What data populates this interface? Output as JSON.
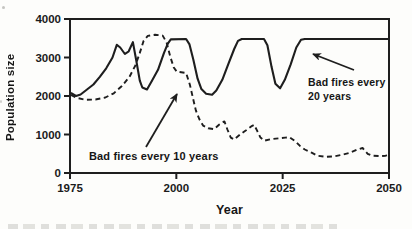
{
  "figure": {
    "background": "#fdfdfb",
    "ink_color": "#1e1e1e"
  },
  "chart_data": {
    "type": "line",
    "title": "",
    "xlabel": "Year",
    "ylabel": "Population size",
    "xlim": [
      1975,
      2050
    ],
    "ylim": [
      0,
      4000
    ],
    "x_ticks": [
      1975,
      2000,
      2025,
      2050
    ],
    "y_ticks": [
      0,
      1000,
      2000,
      3000,
      4000
    ],
    "grid": false,
    "frame": "full-box",
    "legend_position": "in-plot annotations with arrows",
    "series": [
      {
        "name": "Bad fires every 20 years",
        "style": "solid",
        "points": [
          [
            1975.2,
            2080
          ],
          [
            1976.4,
            2000
          ],
          [
            1977.5,
            2040
          ],
          [
            1979,
            2170
          ],
          [
            1980.5,
            2300
          ],
          [
            1982,
            2500
          ],
          [
            1983.5,
            2720
          ],
          [
            1985,
            3000
          ],
          [
            1986,
            3330
          ],
          [
            1986.8,
            3260
          ],
          [
            1987.9,
            3090
          ],
          [
            1988.8,
            3160
          ],
          [
            1989.8,
            3400
          ],
          [
            1990.6,
            2900
          ],
          [
            1991.4,
            2400
          ],
          [
            1992,
            2220
          ],
          [
            1993.1,
            2170
          ],
          [
            1994.3,
            2400
          ],
          [
            1995.7,
            2680
          ],
          [
            1997.1,
            3120
          ],
          [
            1998,
            3360
          ],
          [
            1998.7,
            3470
          ],
          [
            2002.3,
            3480
          ],
          [
            2003.1,
            3340
          ],
          [
            2004,
            2950
          ],
          [
            2005,
            2450
          ],
          [
            2005.9,
            2180
          ],
          [
            2007,
            2060
          ],
          [
            2008.4,
            2030
          ],
          [
            2009.4,
            2140
          ],
          [
            2010.8,
            2420
          ],
          [
            2012.2,
            2820
          ],
          [
            2013.6,
            3220
          ],
          [
            2014.5,
            3430
          ],
          [
            2015.4,
            3480
          ],
          [
            2020.6,
            3480
          ],
          [
            2021.4,
            3320
          ],
          [
            2022.4,
            2750
          ],
          [
            2023.3,
            2320
          ],
          [
            2024.4,
            2200
          ],
          [
            2025.5,
            2420
          ],
          [
            2026.9,
            2820
          ],
          [
            2028.2,
            3260
          ],
          [
            2029.3,
            3460
          ],
          [
            2030.2,
            3480
          ],
          [
            2050,
            3480
          ]
        ]
      },
      {
        "name": "Bad fires every 10 years",
        "style": "dashed",
        "points": [
          [
            1975.2,
            2030
          ],
          [
            1976.6,
            1950
          ],
          [
            1978.6,
            1900
          ],
          [
            1981,
            1910
          ],
          [
            1983.3,
            1960
          ],
          [
            1985.3,
            2070
          ],
          [
            1987.2,
            2260
          ],
          [
            1989,
            2500
          ],
          [
            1990.4,
            2800
          ],
          [
            1991.4,
            3120
          ],
          [
            1992.3,
            3430
          ],
          [
            1993.3,
            3560
          ],
          [
            1995,
            3590
          ],
          [
            1996.8,
            3570
          ],
          [
            1997.7,
            3390
          ],
          [
            1998.6,
            3010
          ],
          [
            1999.4,
            2740
          ],
          [
            2000.1,
            2630
          ],
          [
            2002.3,
            2600
          ],
          [
            2003.2,
            2290
          ],
          [
            2003.9,
            1950
          ],
          [
            2004.6,
            1620
          ],
          [
            2005.4,
            1400
          ],
          [
            2006.3,
            1230
          ],
          [
            2007.5,
            1160
          ],
          [
            2008.9,
            1140
          ],
          [
            2010.1,
            1260
          ],
          [
            2011.3,
            1340
          ],
          [
            2012,
            1130
          ],
          [
            2012.8,
            920
          ],
          [
            2013.6,
            870
          ],
          [
            2015,
            1000
          ],
          [
            2016.4,
            1110
          ],
          [
            2017.6,
            1210
          ],
          [
            2018.3,
            1250
          ],
          [
            2019,
            1100
          ],
          [
            2019.8,
            920
          ],
          [
            2020.7,
            840
          ],
          [
            2022.2,
            880
          ],
          [
            2024.1,
            900
          ],
          [
            2025.6,
            920
          ],
          [
            2026.6,
            930
          ],
          [
            2028,
            820
          ],
          [
            2029,
            710
          ],
          [
            2030.2,
            610
          ],
          [
            2031.8,
            530
          ],
          [
            2033.2,
            450
          ],
          [
            2035,
            420
          ],
          [
            2037,
            430
          ],
          [
            2038.8,
            470
          ],
          [
            2040.7,
            520
          ],
          [
            2042.6,
            610
          ],
          [
            2043.8,
            650
          ],
          [
            2045,
            500
          ],
          [
            2046,
            450
          ],
          [
            2047.8,
            440
          ],
          [
            2049.2,
            450
          ],
          [
            2050,
            470
          ]
        ]
      }
    ],
    "annotations": [
      {
        "lines": [
          "Bad fires every",
          "20 years"
        ],
        "arrow_from_px": [
          354,
          70
        ],
        "arrow_to_px": [
          313,
          54
        ]
      },
      {
        "lines": [
          "Bad fires every 10 years"
        ],
        "arrow_from_px": [
          146,
          147
        ],
        "arrow_to_px": [
          177,
          94
        ]
      }
    ]
  }
}
